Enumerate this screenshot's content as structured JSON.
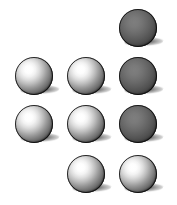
{
  "figure": {
    "name": "sphere-grid",
    "width": 177,
    "height": 205,
    "background_color": "#ffffff",
    "columns": 3,
    "rows": 4,
    "sphere_count": 10,
    "sphere_diameter": 38,
    "column_x": [
      14,
      66,
      118
    ],
    "row_y": [
      8,
      56,
      104,
      154
    ],
    "light_direction": "upper-left",
    "shadow_direction": "lower-right",
    "shadow_color": "#000000"
  },
  "spheres": [
    {
      "id": "sphere-r1c1",
      "row": 1,
      "col": 1,
      "present": false,
      "style": "",
      "label": ""
    },
    {
      "id": "sphere-r1c2",
      "row": 1,
      "col": 2,
      "present": false,
      "style": "",
      "label": ""
    },
    {
      "id": "sphere-r1c3",
      "row": 1,
      "col": 3,
      "present": true,
      "style": "dark",
      "label": "dark matte sphere"
    },
    {
      "id": "sphere-r2c1",
      "row": 2,
      "col": 1,
      "present": true,
      "style": "bright",
      "label": "bright specular sphere"
    },
    {
      "id": "sphere-r2c2",
      "row": 2,
      "col": 2,
      "present": true,
      "style": "bright",
      "label": "bright specular sphere"
    },
    {
      "id": "sphere-r2c3",
      "row": 2,
      "col": 3,
      "present": true,
      "style": "dark",
      "label": "dark matte sphere"
    },
    {
      "id": "sphere-r3c1",
      "row": 3,
      "col": 1,
      "present": true,
      "style": "bright",
      "label": "bright specular sphere"
    },
    {
      "id": "sphere-r3c2",
      "row": 3,
      "col": 2,
      "present": true,
      "style": "bright",
      "label": "bright specular sphere"
    },
    {
      "id": "sphere-r3c3",
      "row": 3,
      "col": 3,
      "present": true,
      "style": "dark",
      "label": "dark matte sphere"
    },
    {
      "id": "sphere-r4c1",
      "row": 4,
      "col": 1,
      "present": false,
      "style": "",
      "label": ""
    },
    {
      "id": "sphere-r4c2",
      "row": 4,
      "col": 2,
      "present": true,
      "style": "bright",
      "label": "bright specular sphere"
    },
    {
      "id": "sphere-r4c3",
      "row": 4,
      "col": 3,
      "present": true,
      "style": "bright",
      "label": "bright specular sphere"
    }
  ]
}
